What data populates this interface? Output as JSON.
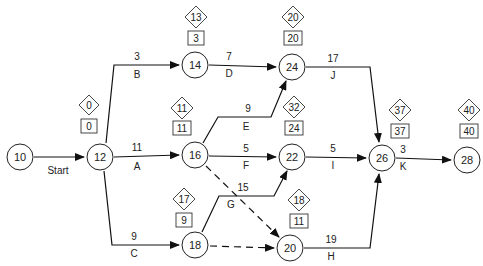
{
  "diagram": {
    "type": "activity-on-arrow network (PERT/CPM)",
    "nodes": [
      {
        "id": "10",
        "x": 20,
        "y": 157
      },
      {
        "id": "12",
        "x": 100,
        "y": 157
      },
      {
        "id": "14",
        "x": 195,
        "y": 65
      },
      {
        "id": "16",
        "x": 195,
        "y": 155
      },
      {
        "id": "18",
        "x": 195,
        "y": 245
      },
      {
        "id": "20",
        "x": 290,
        "y": 248
      },
      {
        "id": "22",
        "x": 292,
        "y": 157
      },
      {
        "id": "24",
        "x": 292,
        "y": 67
      },
      {
        "id": "26",
        "x": 382,
        "y": 158
      },
      {
        "id": "28",
        "x": 467,
        "y": 160
      }
    ],
    "activities": [
      {
        "from": "10",
        "to": "12",
        "label": "Start",
        "duration": ""
      },
      {
        "from": "12",
        "to": "14",
        "label": "B",
        "duration": "3"
      },
      {
        "from": "12",
        "to": "16",
        "label": "A",
        "duration": "11"
      },
      {
        "from": "12",
        "to": "18",
        "label": "C",
        "duration": "9"
      },
      {
        "from": "14",
        "to": "24",
        "label": "D",
        "duration": "7"
      },
      {
        "from": "16",
        "to": "24",
        "label": "E",
        "duration": "9"
      },
      {
        "from": "16",
        "to": "22",
        "label": "F",
        "duration": "5"
      },
      {
        "from": "18",
        "to": "22",
        "label": "G",
        "duration": "15"
      },
      {
        "from": "24",
        "to": "26",
        "label": "J",
        "duration": "17"
      },
      {
        "from": "22",
        "to": "26",
        "label": "I",
        "duration": "5"
      },
      {
        "from": "20",
        "to": "26",
        "label": "H",
        "duration": "19"
      },
      {
        "from": "26",
        "to": "28",
        "label": "K",
        "duration": "3"
      }
    ],
    "dummies": [
      {
        "from": "16",
        "to": "20"
      },
      {
        "from": "18",
        "to": "20"
      }
    ],
    "event_times": [
      {
        "node": "12",
        "diamond": "0",
        "box": "0"
      },
      {
        "node": "14",
        "diamond": "13",
        "box": "3"
      },
      {
        "node": "16",
        "diamond": "11",
        "box": "11"
      },
      {
        "node": "18",
        "diamond": "17",
        "box": "9"
      },
      {
        "node": "24",
        "diamond": "20",
        "box": "20"
      },
      {
        "node": "22",
        "diamond": "32",
        "box": "24"
      },
      {
        "node": "20",
        "diamond": "18",
        "box": "11"
      },
      {
        "node": "26",
        "diamond": "37",
        "box": "37"
      },
      {
        "node": "28",
        "diamond": "40",
        "box": "40"
      }
    ]
  },
  "labels": {
    "n10": "10",
    "n12": "12",
    "n14": "14",
    "n16": "16",
    "n18": "18",
    "n20": "20",
    "n22": "22",
    "n24": "24",
    "n26": "26",
    "n28": "28",
    "start": "Start",
    "b_dur": "3",
    "b": "B",
    "a_dur": "11",
    "a": "A",
    "c_dur": "9",
    "c": "C",
    "d_dur": "7",
    "d": "D",
    "e_dur": "9",
    "e": "E",
    "f_dur": "5",
    "f": "F",
    "g_dur": "15",
    "g": "G",
    "j_dur": "17",
    "j": "J",
    "i_dur": "5",
    "i": "I",
    "h_dur": "19",
    "h": "H",
    "k_dur": "3",
    "k": "K",
    "d12": "0",
    "b12": "0",
    "d14": "13",
    "b14": "3",
    "d16": "11",
    "b16": "11",
    "d18": "17",
    "b18": "9",
    "d24": "20",
    "b24": "20",
    "d22": "32",
    "b22": "24",
    "d20": "18",
    "b20": "11",
    "d26": "37",
    "b26": "37",
    "d28": "40",
    "b28": "40"
  }
}
